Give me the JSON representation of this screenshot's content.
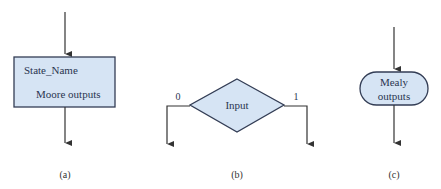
{
  "diagram": {
    "colors": {
      "fill": "#d6e4f4",
      "stroke": "#333d55",
      "line": "#333333",
      "text": "#2a3550"
    },
    "parts": [
      {
        "id": "a",
        "type": "state-box",
        "title": "State_Name",
        "body": "Moore outputs",
        "caption": "(a)"
      },
      {
        "id": "b",
        "type": "decision-diamond",
        "label": "Input",
        "branch_left": "0",
        "branch_right": "1",
        "caption": "(b)"
      },
      {
        "id": "c",
        "type": "conditional-output-oval",
        "line1": "Mealy",
        "line2": "outputs",
        "caption": "(c)"
      }
    ]
  }
}
